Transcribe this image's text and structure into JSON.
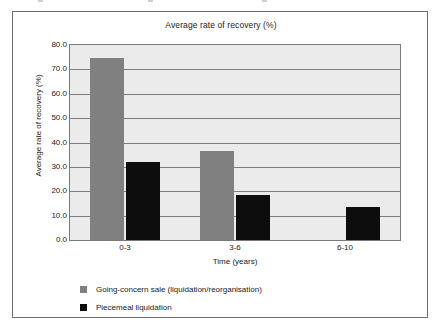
{
  "figure": {
    "title": "Average rate of recovery (%)"
  },
  "chart_data": {
    "type": "bar",
    "title": "Average rate of recovery (%)",
    "xlabel": "Time (years)",
    "ylabel": "Average rate of recovery (%)",
    "categories": [
      "0-3",
      "3-6",
      "6-10"
    ],
    "series": [
      {
        "name": "Going-concern sale (liquidation/reorganisation)",
        "color": "#808080",
        "values": [
          74.5,
          36.5,
          null
        ]
      },
      {
        "name": "Piecemeal liquidation",
        "color": "#0d0d0d",
        "values": [
          32.0,
          18.5,
          13.5
        ]
      }
    ],
    "ylim": [
      0.0,
      80.0
    ],
    "ytick_step": 10.0,
    "yticks": [
      "80.0",
      "70.0",
      "60.0",
      "50.0",
      "40.0",
      "30.0",
      "20.0",
      "10.0",
      "0.0"
    ],
    "ytick_values": [
      80.0,
      70.0,
      60.0,
      50.0,
      40.0,
      30.0,
      20.0,
      10.0,
      0.0
    ],
    "grid": true,
    "grid_axis": "y",
    "legend_position": "bottom-left",
    "plot_background": "#ebebeb"
  },
  "legend": {
    "entries": [
      {
        "label": "Going-concern sale (liquidation/reorganisation)",
        "color": "#808080"
      },
      {
        "label": "Piecemeal liquidation",
        "color": "#0d0d0d"
      }
    ]
  }
}
